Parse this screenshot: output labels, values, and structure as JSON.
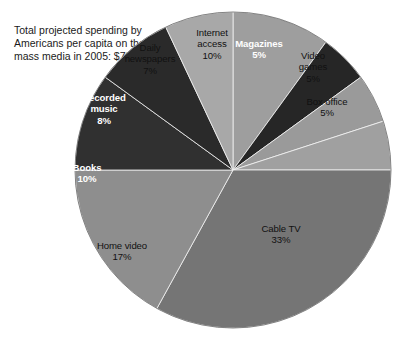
{
  "chart_data": {
    "type": "pie",
    "title": "Total projected spending by Americans per capita on the mass media in 2005: $795.50",
    "xlabel": "",
    "ylabel": "",
    "legend": "none",
    "grid": false,
    "units": "percent",
    "total_label": "$795.50",
    "start_angle_deg": 0,
    "direction": "clockwise",
    "categories": [
      "Internet access",
      "Magazines",
      "Video games",
      "Box office",
      "Cable TV",
      "Home video",
      "Books",
      "Recorded music",
      "Daily newspapers"
    ],
    "values": [
      10,
      5,
      5,
      5,
      33,
      17,
      10,
      8,
      7
    ],
    "slices": [
      {
        "name": "Internet access",
        "label": "Internet\naccess\n10%",
        "value": 10,
        "value_label": "10%",
        "color": "#9e9e9e",
        "text_color": "#111111",
        "text_style": "light-bg",
        "label_x": 212,
        "label_y": 27
      },
      {
        "name": "Magazines",
        "label": "Magazines\n5%",
        "value": 5,
        "value_label": "5%",
        "color": "#262626",
        "text_color": "#ffffff",
        "text_style": "dark-bg",
        "label_x": 259,
        "label_y": 38
      },
      {
        "name": "Video games",
        "label": "Video\ngames\n5%",
        "value": 5,
        "value_label": "5%",
        "color": "#9a9a9a",
        "text_color": "#111111",
        "text_style": "light-bg",
        "label_x": 313,
        "label_y": 50
      },
      {
        "name": "Box office",
        "label": "Box office\n5%",
        "value": 5,
        "value_label": "5%",
        "color": "#a0a0a0",
        "text_color": "#111111",
        "text_style": "light-bg",
        "label_x": 327,
        "label_y": 96
      },
      {
        "name": "Cable TV",
        "label": "Cable TV\n33%",
        "value": 33,
        "value_label": "33%",
        "color": "#757575",
        "text_color": "#111111",
        "text_style": "light-bg",
        "label_x": 281,
        "label_y": 223
      },
      {
        "name": "Home video",
        "label": "Home video\n17%",
        "value": 17,
        "value_label": "17%",
        "color": "#8e8e8e",
        "text_color": "#111111",
        "text_style": "light-bg",
        "label_x": 122,
        "label_y": 240
      },
      {
        "name": "Books",
        "label": "Books\n10%",
        "value": 10,
        "value_label": "10%",
        "color": "#303030",
        "text_color": "#ffffff",
        "text_style": "dark-bg",
        "label_x": 87,
        "label_y": 162
      },
      {
        "name": "Recorded music",
        "label": "Recorded\nmusic\n8%",
        "value": 8,
        "value_label": "8%",
        "color": "#2a2a2a",
        "text_color": "#ffffff",
        "text_style": "dark-bg",
        "label_x": 104,
        "label_y": 92
      },
      {
        "name": "Daily newspapers",
        "label": "Daily\nnewspapers\n7%",
        "value": 7,
        "value_label": "7%",
        "color": "#a8a8a8",
        "text_color": "#111111",
        "text_style": "light-bg",
        "label_x": 150,
        "label_y": 42
      }
    ],
    "geometry": {
      "center_x": 233,
      "center_y": 170,
      "radius": 158
    },
    "background_color": "#ffffff"
  }
}
